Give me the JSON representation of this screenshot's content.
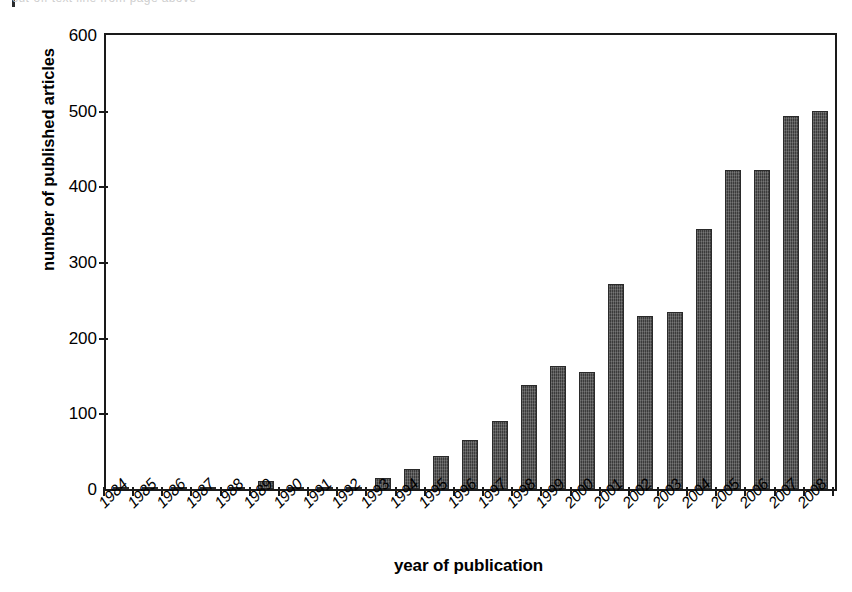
{
  "chart_data": {
    "type": "bar",
    "title": "",
    "xlabel": "year of publication",
    "ylabel": "number of published articles",
    "ylim": [
      0,
      600
    ],
    "ytick_labels": [
      "600",
      "500",
      "400",
      "300",
      "200",
      "100",
      "0"
    ],
    "yticks": [
      600,
      500,
      400,
      300,
      200,
      100,
      0
    ],
    "grid": false,
    "legend": null,
    "bar_color": "#3b3b3b",
    "categories": [
      "1984",
      "1985",
      "1986",
      "1987",
      "1988",
      "1989",
      "1990",
      "1991",
      "1992",
      "1993",
      "1994",
      "1995",
      "1996",
      "1997",
      "1998",
      "1999",
      "2000",
      "2001",
      "2002",
      "2003",
      "2004",
      "2005",
      "2006",
      "2007",
      "2008"
    ],
    "values": [
      1,
      1,
      1,
      1,
      2,
      10,
      3,
      2,
      2,
      14,
      26,
      43,
      65,
      90,
      137,
      162,
      155,
      271,
      229,
      234,
      344,
      421,
      421,
      493,
      500
    ]
  },
  "artifact": {
    "top_sliver_text": "cut-off text line from page above"
  }
}
